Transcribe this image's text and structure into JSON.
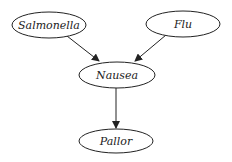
{
  "diagram": {
    "type": "directed-graph",
    "nodes": [
      {
        "id": "salmonella",
        "label": "Salmonella",
        "cx": 49,
        "cy": 25,
        "rx": 37,
        "ry": 13
      },
      {
        "id": "flu",
        "label": "Flu",
        "cx": 183,
        "cy": 24,
        "rx": 37,
        "ry": 13
      },
      {
        "id": "nausea",
        "label": "Nausea",
        "cx": 117,
        "cy": 75,
        "rx": 38,
        "ry": 13
      },
      {
        "id": "pallor",
        "label": "Pallor",
        "cx": 116,
        "cy": 141,
        "rx": 37,
        "ry": 12
      }
    ],
    "edges": [
      {
        "from": "salmonella",
        "to": "nausea"
      },
      {
        "from": "flu",
        "to": "nausea"
      },
      {
        "from": "nausea",
        "to": "pallor"
      }
    ],
    "colors": {
      "stroke": "#222222",
      "background": "#ffffff"
    }
  }
}
